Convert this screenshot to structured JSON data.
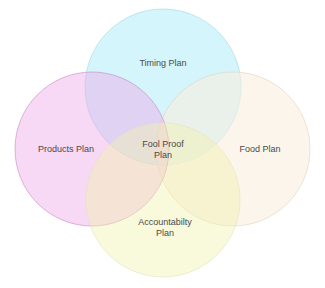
{
  "diagram": {
    "type": "venn",
    "sets": [
      {
        "id": "timing",
        "label": "Timing Plan",
        "fill": "#c9f3fb",
        "stroke": "#a9dfe8"
      },
      {
        "id": "products",
        "label": "Products Plan",
        "fill": "#f3b8ee",
        "stroke": "#c996c4"
      },
      {
        "id": "food",
        "label": "Food Plan",
        "fill": "#fbf3e2",
        "stroke": "#e6d9c4"
      },
      {
        "id": "accountability",
        "label_line1": "Accountabilty",
        "label_line2": "Plan",
        "fill": "#f4f5c9",
        "stroke": "#e4e6bf"
      }
    ],
    "center": {
      "label_line1": "Fool Proof",
      "label_line2": "Plan"
    }
  }
}
